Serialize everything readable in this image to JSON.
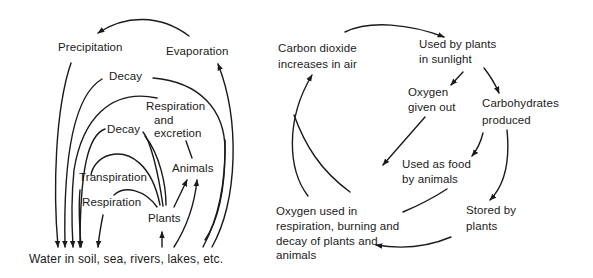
{
  "left_diagram": {
    "name": "Water cycle",
    "labels": {
      "precipitation": "Precipitation",
      "evaporation": "Evaporation",
      "decay_outer": "Decay",
      "respiration_excretion": [
        "Respiration",
        "and",
        "excretion"
      ],
      "decay_inner": "Decay",
      "animals": "Animals",
      "transpiration": "Transpiration",
      "respiration": "Respiration",
      "plants": "Plants",
      "water": "Water in soil, sea, rivers, lakes, etc."
    }
  },
  "right_diagram": {
    "name": "Carbon-oxygen cycle",
    "labels": {
      "co2": [
        "Carbon dioxide",
        "increases in air"
      ],
      "used_by_plants": [
        "Used by plants",
        "in sunlight"
      ],
      "oxygen_given_out": [
        "Oxygen",
        "given out"
      ],
      "carbohydrates": [
        "Carbohydrates",
        "produced"
      ],
      "used_as_food": [
        "Used as food",
        "by animals"
      ],
      "oxygen_used": [
        "Oxygen used in",
        "respiration, burning and",
        "decay of plants and",
        "animals"
      ],
      "stored": [
        "Stored by",
        "plants"
      ]
    }
  },
  "colors": {
    "ink": "#1a1a1a",
    "background": "#ffffff"
  }
}
